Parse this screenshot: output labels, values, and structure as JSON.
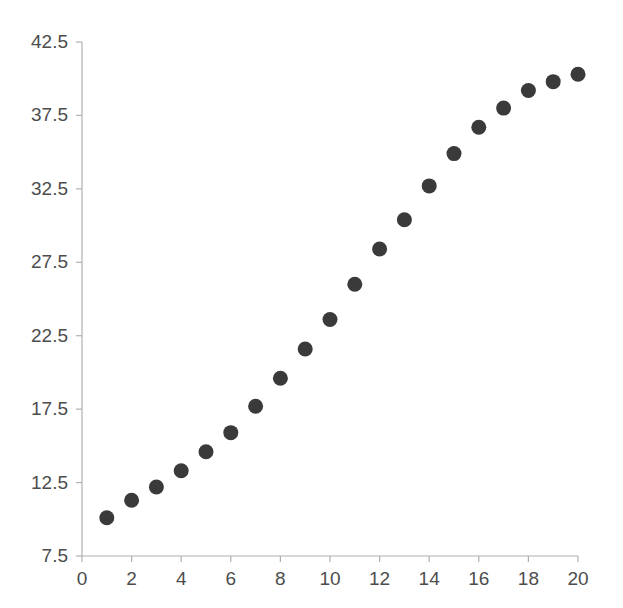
{
  "chart_data": {
    "type": "scatter",
    "title": "",
    "subtitle": "",
    "xlabel": "",
    "ylabel": "",
    "x": [
      1,
      2,
      3,
      4,
      5,
      6,
      7,
      8,
      9,
      10,
      11,
      12,
      13,
      14,
      15,
      16,
      17,
      18,
      19,
      20
    ],
    "values": [
      10.1,
      11.3,
      12.2,
      13.3,
      14.6,
      15.9,
      17.7,
      19.6,
      21.6,
      23.6,
      26.0,
      28.4,
      30.4,
      32.7,
      34.9,
      36.7,
      38.0,
      39.2,
      39.8,
      40.3
    ],
    "series": [
      {
        "name": "series-1",
        "marker": "circle",
        "color": "#3a3a3a",
        "values": [
          10.1,
          11.3,
          12.2,
          13.3,
          14.6,
          15.9,
          17.7,
          19.6,
          21.6,
          23.6,
          26.0,
          28.4,
          30.4,
          32.7,
          34.9,
          36.7,
          38.0,
          39.2,
          39.8,
          40.3
        ]
      }
    ],
    "xlim": [
      0,
      20
    ],
    "ylim": [
      7.5,
      42.5
    ],
    "xticks": [
      0,
      2,
      4,
      6,
      8,
      10,
      12,
      14,
      16,
      18,
      20
    ],
    "xtick_labels": [
      "0",
      "2",
      "4",
      "6",
      "8",
      "10",
      "12",
      "14",
      "16",
      "18",
      "20"
    ],
    "yticks": [
      7.5,
      12.5,
      17.5,
      22.5,
      27.5,
      32.5,
      37.5,
      42.5
    ],
    "ytick_labels": [
      "7.5",
      "12.5",
      "17.5",
      "22.5",
      "27.5",
      "32.5",
      "37.5",
      "42.5"
    ],
    "grid": false,
    "legend": null,
    "legend_position": "none",
    "annotations": [],
    "colors": {
      "marker": "#3a3a3a",
      "axis": "#b0b0b0",
      "tick_text": "#4d4d4d",
      "background": "#ffffff"
    }
  },
  "layout": {
    "plot_left_px": 82,
    "plot_right_px": 578,
    "plot_top_px": 42,
    "plot_bottom_px": 556,
    "marker_radius_px": 7.5
  }
}
